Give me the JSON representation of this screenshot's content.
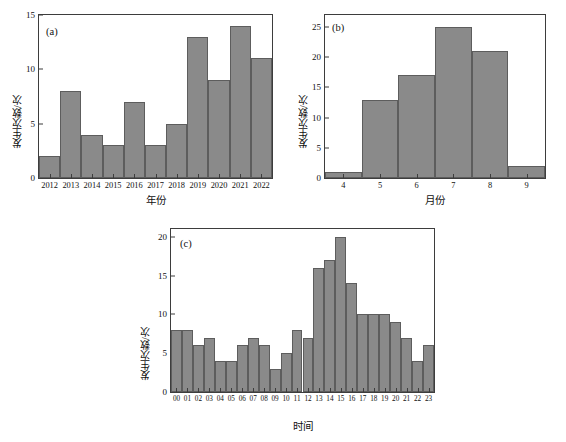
{
  "figure": {
    "background_color": "#ffffff",
    "bar_color": "#8a8a8a",
    "bar_edge_color": "#5d5d5d",
    "axis_color": "#3d3d3d"
  },
  "panels": {
    "a": {
      "tag": "(a)",
      "ylabel": "发生次数/次",
      "xlabel": "年份"
    },
    "b": {
      "tag": "(b)",
      "ylabel": "发生次数/次",
      "xlabel": "月份"
    },
    "c": {
      "tag": "(c)",
      "ylabel": "发生次数/次",
      "xlabel": "时间"
    }
  },
  "chart_data": [
    {
      "id": "a",
      "type": "bar",
      "title": "(a)",
      "xlabel": "年份",
      "ylabel": "发生次数/次",
      "categories": [
        "2012",
        "2013",
        "2014",
        "2015",
        "2016",
        "2017",
        "2018",
        "2019",
        "2020",
        "2021",
        "2022"
      ],
      "values": [
        2,
        8,
        4,
        3,
        7,
        3,
        5,
        13,
        9,
        14,
        11
      ],
      "ylim": [
        0,
        15
      ],
      "yticks": [
        0,
        5,
        10,
        15
      ],
      "grid": false,
      "legend": null
    },
    {
      "id": "b",
      "type": "bar",
      "title": "(b)",
      "xlabel": "月份",
      "ylabel": "发生次数/次",
      "categories": [
        "4",
        "5",
        "6",
        "7",
        "8",
        "9"
      ],
      "values": [
        1,
        13,
        17,
        25,
        21,
        2
      ],
      "ylim": [
        0,
        27
      ],
      "yticks": [
        0,
        5,
        10,
        15,
        20,
        25
      ],
      "grid": false,
      "legend": null
    },
    {
      "id": "c",
      "type": "bar",
      "title": "(c)",
      "xlabel": "时间",
      "ylabel": "发生次数/次",
      "categories": [
        "00",
        "01",
        "02",
        "03",
        "04",
        "05",
        "06",
        "07",
        "08",
        "09",
        "10",
        "11",
        "12",
        "13",
        "14",
        "15",
        "16",
        "17",
        "18",
        "19",
        "20",
        "21",
        "22",
        "23"
      ],
      "values": [
        8,
        8,
        6,
        7,
        4,
        4,
        6,
        7,
        6,
        3,
        5,
        8,
        7,
        16,
        17,
        20,
        14,
        10,
        10,
        10,
        9,
        7,
        4,
        6
      ],
      "ylim": [
        0,
        21
      ],
      "yticks": [
        0,
        5,
        10,
        15,
        20
      ],
      "grid": false,
      "legend": null
    }
  ]
}
